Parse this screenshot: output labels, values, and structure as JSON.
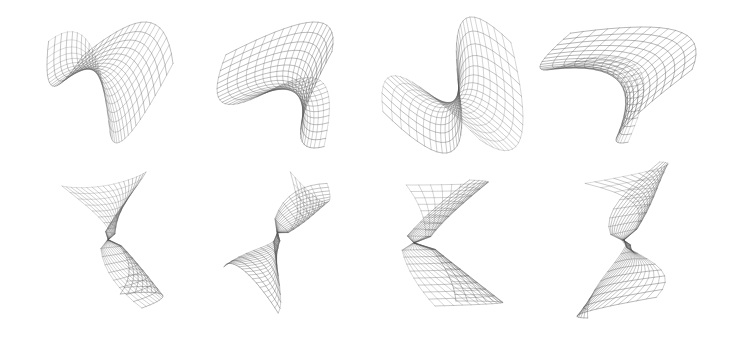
{
  "figure": {
    "background": "#ffffff",
    "line_color": "#555555",
    "rows": [
      {
        "name": "perspective-views",
        "panels": [
          {
            "id": "top-1",
            "x": 45,
            "y": 20,
            "w": 130,
            "h": 125,
            "kind": "saddle",
            "variant": 0
          },
          {
            "id": "top-2",
            "x": 215,
            "y": 20,
            "w": 120,
            "h": 130,
            "kind": "saddle",
            "variant": 1
          },
          {
            "id": "top-3",
            "x": 380,
            "y": 15,
            "w": 145,
            "h": 140,
            "kind": "saddle",
            "variant": 2
          },
          {
            "id": "top-4",
            "x": 538,
            "y": 25,
            "w": 160,
            "h": 120,
            "kind": "saddle",
            "variant": 3
          }
        ]
      },
      {
        "name": "twisted-views",
        "panels": [
          {
            "id": "bot-1",
            "x": 60,
            "y": 170,
            "w": 105,
            "h": 140,
            "kind": "hourglass",
            "variant": 0
          },
          {
            "id": "bot-2",
            "x": 222,
            "y": 170,
            "w": 110,
            "h": 145,
            "kind": "hourglass",
            "variant": 1
          },
          {
            "id": "bot-3",
            "x": 400,
            "y": 178,
            "w": 105,
            "h": 130,
            "kind": "hourglass",
            "variant": 2
          },
          {
            "id": "bot-4",
            "x": 575,
            "y": 160,
            "w": 95,
            "h": 160,
            "kind": "hourglass",
            "variant": 3
          }
        ]
      }
    ]
  }
}
